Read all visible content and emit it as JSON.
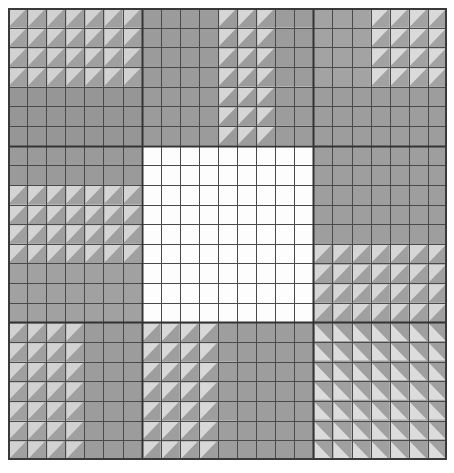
{
  "figure": {
    "title": "",
    "background_color": "#ffffff",
    "plot_left": 8,
    "plot_top": 8,
    "plot_width": 439,
    "plot_height": 452
  },
  "chart_data": {
    "type": "heatmap",
    "title": "",
    "xlabel": "",
    "ylabel": "",
    "grid": true,
    "legend_position": "none",
    "n_cols": 23,
    "n_rows": 23,
    "xlim": [
      0,
      23
    ],
    "ylim": [
      0,
      23
    ],
    "cell_line_color": "#4a4a4a",
    "cell_line_width": 1,
    "block_line_color": "#333333",
    "block_line_width": 2,
    "outer_border_color": "#3a3a3a",
    "outer_border_width": 2,
    "block_col_edges": [
      0,
      7,
      16,
      23
    ],
    "block_row_edges": [
      0,
      7,
      16,
      23
    ],
    "palette": {
      "base_gray": "#a0a0a0",
      "dark_gray": "#8c8c8c",
      "mid_gray": "#9a9a9a",
      "light_tri": "#d8d8d8",
      "pale_tri": "#c9c9c9",
      "dark_tri": "#8a8a8a",
      "white": "#fdfdfd"
    },
    "blocks": [
      {
        "name": "top-left",
        "row": 0,
        "col": 0,
        "fill": "#a0a0a0",
        "hatch": "triangle",
        "tri_corner": "upper-left",
        "tri_color": "#d2d2d2",
        "tri_rows": [
          0,
          4
        ],
        "tri_cols": [
          0,
          7
        ]
      },
      {
        "name": "top-center",
        "row": 0,
        "col": 1,
        "fill": "#9c9c9c",
        "hatch": "triangle",
        "tri_corner": "upper-left",
        "tri_color": "#d6d6d6",
        "tri_rows": [
          0,
          7
        ],
        "tri_cols": [
          4,
          7
        ]
      },
      {
        "name": "top-right",
        "row": 0,
        "col": 2,
        "fill": "#a2a2a2",
        "hatch": "triangle",
        "tri_corner": "upper-left",
        "tri_color": "#dadada",
        "tri_rows": [
          0,
          4
        ],
        "tri_cols": [
          3,
          7
        ]
      },
      {
        "name": "middle-left",
        "row": 1,
        "col": 0,
        "fill": "#a0a0a0",
        "hatch": "triangle",
        "tri_corner": "upper-left",
        "tri_color": "#d4d4d4",
        "tri_rows": [
          2,
          6
        ],
        "tri_cols": [
          0,
          7
        ]
      },
      {
        "name": "middle-center",
        "row": 1,
        "col": 1,
        "fill": "#fdfdfd",
        "hatch": "none",
        "tri_corner": "none",
        "tri_color": "#fdfdfd",
        "tri_rows": [
          0,
          0
        ],
        "tri_cols": [
          0,
          0
        ]
      },
      {
        "name": "middle-right",
        "row": 1,
        "col": 2,
        "fill": "#a0a0a0",
        "hatch": "triangle",
        "tri_corner": "upper-left",
        "tri_color": "#d6d6d6",
        "tri_rows": [
          5,
          9
        ],
        "tri_cols": [
          0,
          7
        ]
      },
      {
        "name": "bottom-left",
        "row": 2,
        "col": 0,
        "fill": "#a0a0a0",
        "hatch": "triangle",
        "tri_corner": "upper-left",
        "tri_color": "#d2d2d2",
        "tri_rows": [
          0,
          7
        ],
        "tri_cols": [
          0,
          4
        ]
      },
      {
        "name": "bottom-center",
        "row": 2,
        "col": 1,
        "fill": "#9e9e9e",
        "hatch": "triangle",
        "tri_corner": "upper-left",
        "tri_color": "#d8d8d8",
        "tri_rows": [
          0,
          7
        ],
        "tri_cols": [
          0,
          4
        ]
      },
      {
        "name": "bottom-right",
        "row": 2,
        "col": 2,
        "fill": "#a0a0a0",
        "hatch": "triangle",
        "tri_corner": "lower-left",
        "tri_color": "#dcdcdc",
        "tri_rows": [
          0,
          7
        ],
        "tri_cols": [
          0,
          7
        ]
      }
    ],
    "extra_regions": [
      {
        "name": "top-left-dark-column",
        "rows": [
          4,
          7
        ],
        "cols": [
          0,
          7
        ],
        "fill": "#969696"
      },
      {
        "name": "top-center-plain",
        "rows": [
          0,
          7
        ],
        "cols": [
          7,
          12
        ],
        "fill": "#9b9b9b"
      },
      {
        "name": "top-right-plain",
        "rows": [
          0,
          7
        ],
        "cols": [
          16,
          19
        ],
        "fill": "#a3a3a3"
      },
      {
        "name": "top-right-lower",
        "rows": [
          4,
          7
        ],
        "cols": [
          16,
          23
        ],
        "fill": "#9d9d9d"
      },
      {
        "name": "middle-left-upper",
        "rows": [
          7,
          9
        ],
        "cols": [
          0,
          7
        ],
        "fill": "#9a9a9a"
      },
      {
        "name": "middle-left-lower",
        "rows": [
          13,
          16
        ],
        "cols": [
          0,
          7
        ],
        "fill": "#a1a1a1"
      },
      {
        "name": "middle-right-upper",
        "rows": [
          7,
          12
        ],
        "cols": [
          16,
          23
        ],
        "fill": "#9e9e9e"
      },
      {
        "name": "bottom-left-right",
        "rows": [
          16,
          23
        ],
        "cols": [
          4,
          7
        ],
        "fill": "#9c9c9c"
      },
      {
        "name": "bottom-center-right",
        "rows": [
          16,
          23
        ],
        "cols": [
          12,
          16
        ],
        "fill": "#9d9d9d"
      },
      {
        "name": "bottom-right-upper",
        "rows": [
          16,
          19
        ],
        "cols": [
          16,
          23
        ],
        "fill": "#9f9f9f"
      }
    ],
    "cells_total": 529
  }
}
